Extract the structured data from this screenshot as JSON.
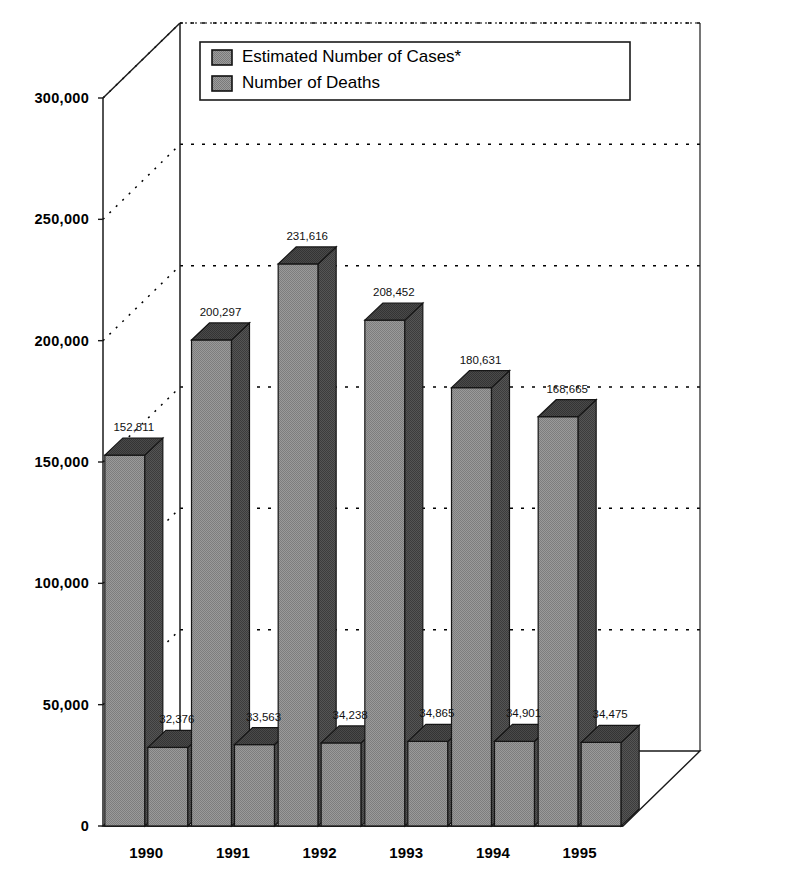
{
  "chart_data": {
    "type": "bar",
    "title": "",
    "subtitle": "",
    "xlabel": "",
    "ylabel": "",
    "categories": [
      "1990",
      "1991",
      "1992",
      "1993",
      "1994",
      "1995"
    ],
    "series": [
      {
        "name": "Estimated Number of Cases*",
        "values": [
          152811,
          200297,
          231616,
          208452,
          180631,
          168665
        ],
        "labels": [
          "152,811",
          "200,297",
          "231,616",
          "208,452",
          "180,631",
          "168,665"
        ],
        "front_color": "#8f8f8f",
        "side_color": "#4d4d4d",
        "top_color": "#404040"
      },
      {
        "name": "Number of Deaths",
        "values": [
          32376,
          33563,
          34238,
          34865,
          34901,
          34475
        ],
        "labels": [
          "32,376",
          "33,563",
          "34,238",
          "34,865",
          "34,901",
          "34,475"
        ],
        "front_color": "#8f8f8f",
        "side_color": "#4d4d4d",
        "top_color": "#404040"
      }
    ],
    "ylim": [
      0,
      300000
    ],
    "ytick_values": [
      0,
      50000,
      100000,
      150000,
      200000,
      250000,
      300000
    ],
    "ytick_labels": [
      "0",
      "50,000",
      "100,000",
      "150,000",
      "200,000",
      "250,000",
      "300,000"
    ],
    "grid": true,
    "grid_style": "dotted",
    "legend_position": "top-left-inside",
    "projection": "3d-isometric",
    "footnote": "*"
  },
  "legend": {
    "items": [
      {
        "label": "Estimated Number of Cases*",
        "swatch": "legend-swatch-cases"
      },
      {
        "label": "Number of Deaths",
        "swatch": "legend-swatch-deaths"
      }
    ]
  }
}
